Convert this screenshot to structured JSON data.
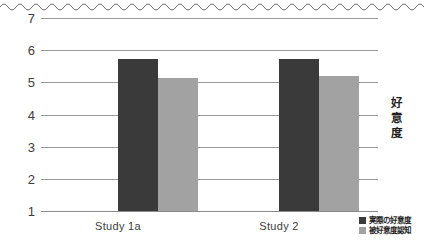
{
  "chart_data": {
    "type": "bar",
    "title": "",
    "subtitle": "",
    "xlabel": "",
    "ylabel": "好意度",
    "ylim": [
      1,
      7
    ],
    "yticks": [
      7,
      6,
      5,
      4,
      3,
      2,
      1
    ],
    "ytick_labels": [
      "7",
      "6",
      "5",
      "4",
      "3",
      "2",
      "1"
    ],
    "grid": true,
    "axis_break": true,
    "axis_break_style": "wavy-line-top",
    "legend_position": "bottom-right",
    "categories": [
      "Study 1a",
      "Study 2"
    ],
    "series": [
      {
        "name": "実際の好意度",
        "color": "#3a3a3a",
        "values": [
          5.72,
          5.72
        ]
      },
      {
        "name": "被好意度認知",
        "color": "#a2a2a2",
        "values": [
          5.13,
          5.2
        ]
      }
    ]
  },
  "axis": {
    "title_chars": [
      "好",
      "意",
      "度"
    ]
  }
}
